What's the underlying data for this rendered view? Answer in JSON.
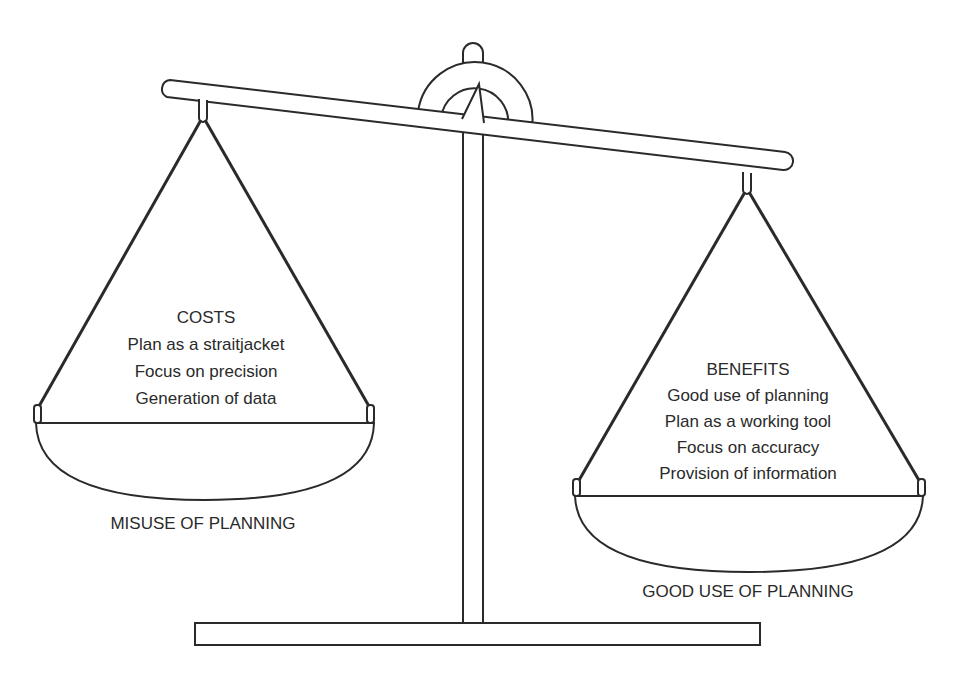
{
  "diagram": {
    "type": "balance-scale",
    "tilt": "heavier side is right (good use of planning)"
  },
  "left_pan": {
    "heading": "COSTS",
    "items": [
      "Plan as a straitjacket",
      "Focus on precision",
      "Generation of data"
    ],
    "caption": "MISUSE OF PLANNING"
  },
  "right_pan": {
    "heading": "BENEFITS",
    "items": [
      "Good use of planning",
      "Plan as a working tool",
      "Focus on accuracy",
      "Provision of information"
    ],
    "caption": "GOOD USE OF PLANNING"
  },
  "colors": {
    "stroke": "#2a2a2a",
    "background": "#ffffff"
  }
}
